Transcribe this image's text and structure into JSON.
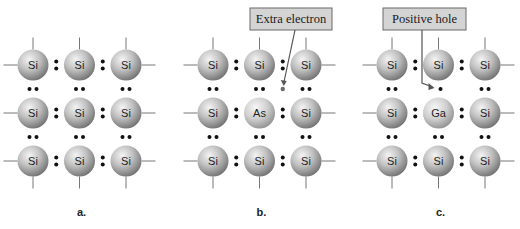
{
  "colors": {
    "atom_light": "#f2f2f2",
    "atom_mid": "#b5b5b5",
    "atom_dark": "#6e6e6e",
    "bond_line": "#777777",
    "electron": "#111111",
    "extra_electron": "#6a6a6a",
    "callout_fill": "#d4d4d4",
    "callout_border": "#6a6a6a"
  },
  "panels": [
    {
      "label": "a.",
      "grid": [
        [
          "Si",
          "Si",
          "Si"
        ],
        [
          "Si",
          "Si",
          "Si"
        ],
        [
          "Si",
          "Si",
          "Si"
        ]
      ],
      "callout": null
    },
    {
      "label": "b.",
      "grid": [
        [
          "Si",
          "Si",
          "Si"
        ],
        [
          "Si",
          "As",
          "Si"
        ],
        [
          "Si",
          "Si",
          "Si"
        ]
      ],
      "callout": {
        "text": "Extra electron",
        "marker": "extra-electron"
      }
    },
    {
      "label": "c.",
      "grid": [
        [
          "Si",
          "Si",
          "Si"
        ],
        [
          "Si",
          "Ga",
          "Si"
        ],
        [
          "Si",
          "Si",
          "Si"
        ]
      ],
      "callout": {
        "text": "Positive hole",
        "marker": "hole"
      }
    }
  ]
}
